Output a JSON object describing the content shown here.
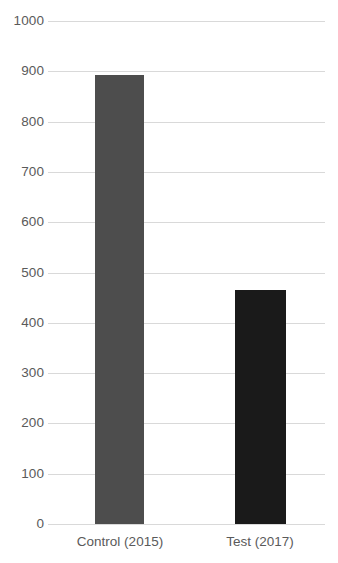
{
  "chart_data": {
    "type": "bar",
    "title": "",
    "subtitle": "",
    "xlabel": "",
    "ylabel": "",
    "categories": [
      "Control (2015)",
      "Test (2017)"
    ],
    "values": [
      893,
      465
    ],
    "ylim": [
      0,
      1000
    ],
    "y_ticks": [
      0,
      100,
      200,
      300,
      400,
      500,
      600,
      700,
      800,
      900,
      1000
    ],
    "y_tick_labels": [
      "0",
      "100",
      "200",
      "300",
      "400",
      "500",
      "600",
      "700",
      "800",
      "900",
      "1000"
    ],
    "grid": "horizontal",
    "legend": "none",
    "bar_colors": [
      "#4d4d4d",
      "#1a1a1a"
    ],
    "background_color": "#ffffff",
    "gridline_color": "#d9d9d9",
    "tick_label_color": "#5a5a5a",
    "annotations": []
  },
  "axis": {
    "y_tick_0": "0",
    "y_tick_1": "100",
    "y_tick_2": "200",
    "y_tick_3": "300",
    "y_tick_4": "400",
    "y_tick_5": "500",
    "y_tick_6": "600",
    "y_tick_7": "700",
    "y_tick_8": "800",
    "y_tick_9": "900",
    "y_tick_10": "1000"
  },
  "categories": {
    "cat_0": "Control (2015)",
    "cat_1": "Test (2017)"
  }
}
